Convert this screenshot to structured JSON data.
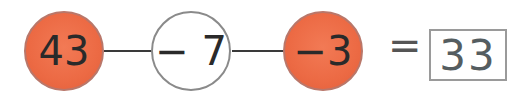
{
  "nodes": [
    {
      "label": "43",
      "style": "filled"
    },
    {
      "label": "− 7",
      "style": "empty"
    },
    {
      "label": "−3",
      "style": "filled"
    }
  ],
  "equals": "=",
  "answer": "33",
  "colors": {
    "filled": "#ec6a44",
    "line": "#3a3a3a",
    "box_border": "#9a9a9a"
  }
}
